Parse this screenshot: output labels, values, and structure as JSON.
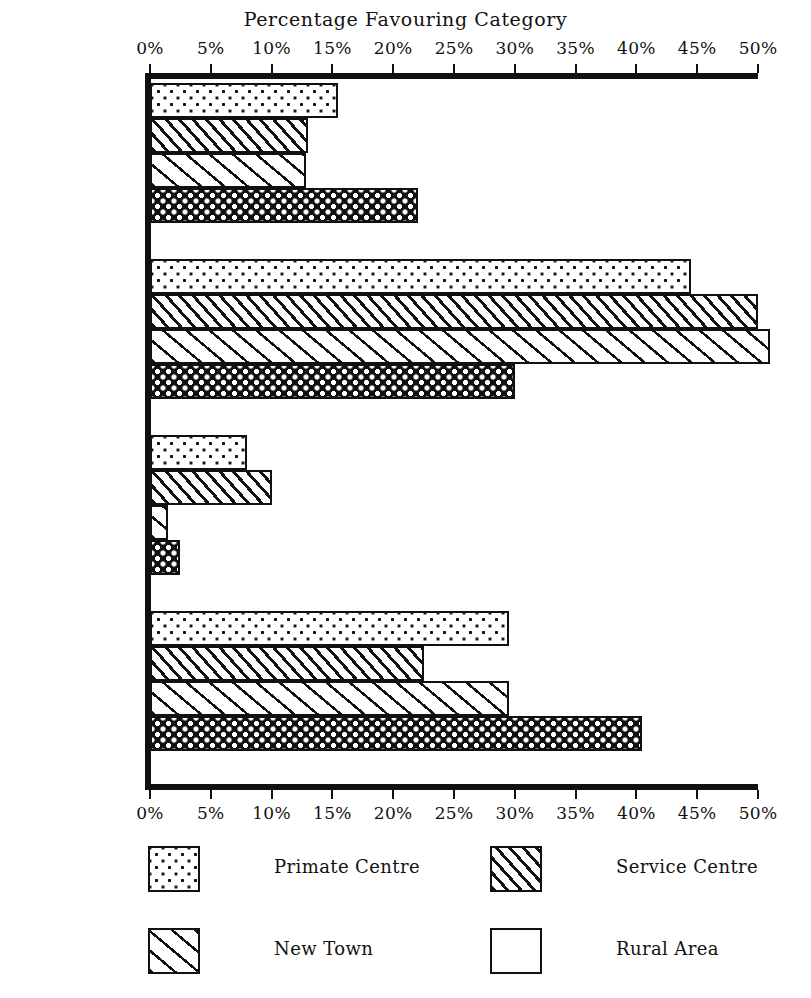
{
  "chart_data": {
    "type": "bar",
    "orientation": "horizontal",
    "title": "Percentage Favouring Category",
    "xlabel": "",
    "ylabel": "",
    "xlim": [
      0,
      50
    ],
    "xtick_values": [
      0,
      5,
      10,
      15,
      20,
      25,
      30,
      35,
      40,
      45,
      50
    ],
    "xtick_labels": [
      "0%",
      "5%",
      "10%",
      "15%",
      "20%",
      "25%",
      "30%",
      "35%",
      "40%",
      "45%",
      "50%"
    ],
    "grid": false,
    "axis_positions": [
      "top",
      "bottom"
    ],
    "legend_position": "bottom",
    "categories": [
      "Present Pattern Retained",
      "More Small Towns",
      "More Large Cities",
      "More Rural Settlement"
    ],
    "category_label_lines": [
      [
        "Present",
        "Pattern",
        "Retained"
      ],
      [
        "More Small",
        "Towns"
      ],
      [
        "More Large",
        "Cities"
      ],
      [
        "More Rural",
        "Settlement"
      ]
    ],
    "series": [
      {
        "name": "Primate Centre",
        "pattern": "fine-dots",
        "values": [
          15.5,
          44.5,
          8.0,
          29.5
        ]
      },
      {
        "name": "Service Centre",
        "pattern": "dense-hatch",
        "values": [
          13.0,
          50.0,
          10.0,
          22.5
        ]
      },
      {
        "name": "New Town",
        "pattern": "wide-hatch",
        "values": [
          12.8,
          51.0,
          1.5,
          29.5
        ]
      },
      {
        "name": "Rural Area",
        "pattern": "cross-hatch",
        "values": [
          22.0,
          30.0,
          2.5,
          40.5
        ]
      }
    ]
  },
  "legend": {
    "items": [
      {
        "label": "Primate Centre",
        "pattern": "fine-dots"
      },
      {
        "label": "Service Centre",
        "pattern": "dense-hatch"
      },
      {
        "label": "New Town",
        "pattern": "wide-hatch"
      },
      {
        "label": "Rural Area",
        "pattern": "cross-hatch"
      }
    ]
  },
  "colors": {
    "ink": "#111111",
    "paper": "#ffffff"
  }
}
